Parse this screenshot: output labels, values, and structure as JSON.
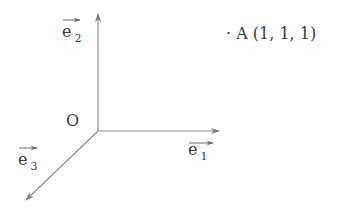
{
  "diagram": {
    "type": "coordinate-axes-3d",
    "origin": {
      "label": "O"
    },
    "vectors": [
      {
        "id": "e1",
        "base": "e",
        "subscript": "1",
        "direction": "right"
      },
      {
        "id": "e2",
        "base": "e",
        "subscript": "2",
        "direction": "up"
      },
      {
        "id": "e3",
        "base": "e",
        "subscript": "3",
        "direction": "down-left"
      }
    ],
    "point": {
      "marker": "·",
      "label": "A",
      "coords": "(1, 1, 1)"
    },
    "colors": {
      "axis": "#808080",
      "text": "#3a3a3a",
      "background": "#ffffff"
    }
  }
}
